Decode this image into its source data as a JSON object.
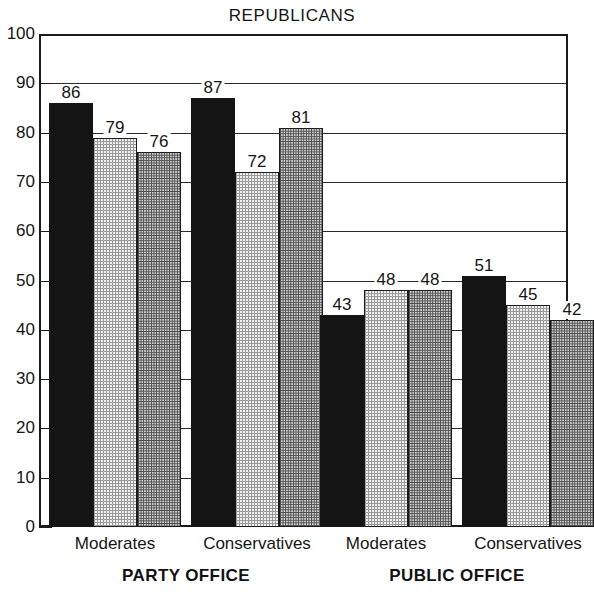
{
  "chart_data": {
    "type": "bar",
    "title": "REPUBLICANS",
    "xlabel": "",
    "ylabel": "",
    "ylim": [
      0,
      100
    ],
    "ytick_step": 10,
    "yticks": [
      0,
      10,
      20,
      30,
      40,
      50,
      60,
      70,
      80,
      90,
      100
    ],
    "grid": true,
    "legend": "none",
    "categories": [
      "Moderates",
      "Conservatives",
      "Moderates",
      "Conservatives"
    ],
    "group_labels": [
      "PARTY OFFICE",
      "PUBLIC OFFICE"
    ],
    "series": [
      {
        "name": "series-1",
        "fill": "solid-black",
        "values": [
          86,
          87,
          43,
          51
        ]
      },
      {
        "name": "series-2",
        "fill": "light-stipple",
        "values": [
          79,
          72,
          48,
          45
        ]
      },
      {
        "name": "series-3",
        "fill": "medium-stipple",
        "values": [
          76,
          81,
          48,
          42
        ]
      }
    ],
    "groups": [
      {
        "section": "PARTY OFFICE",
        "category": "Moderates",
        "bars": [
          {
            "value": 86,
            "label": "86",
            "fill": "solid-black"
          },
          {
            "value": 79,
            "label": "79",
            "fill": "light-stipple"
          },
          {
            "value": 76,
            "label": "76",
            "fill": "medium-stipple"
          }
        ]
      },
      {
        "section": "PARTY OFFICE",
        "category": "Conservatives",
        "bars": [
          {
            "value": 87,
            "label": "87",
            "fill": "solid-black"
          },
          {
            "value": 72,
            "label": "72",
            "fill": "light-stipple"
          },
          {
            "value": 81,
            "label": "81",
            "fill": "medium-stipple"
          }
        ]
      },
      {
        "section": "PUBLIC OFFICE",
        "category": "Moderates",
        "bars": [
          {
            "value": 43,
            "label": "43",
            "fill": "solid-black"
          },
          {
            "value": 48,
            "label": "48",
            "fill": "light-stipple"
          },
          {
            "value": 48,
            "label": "48",
            "fill": "medium-stipple"
          }
        ]
      },
      {
        "section": "PUBLIC OFFICE",
        "category": "Conservatives",
        "bars": [
          {
            "value": 51,
            "label": "51",
            "fill": "solid-black"
          },
          {
            "value": 45,
            "label": "45",
            "fill": "light-stipple"
          },
          {
            "value": 42,
            "label": "42",
            "fill": "medium-stipple"
          }
        ]
      }
    ],
    "colors": {
      "axis": "#1b1b1b",
      "grid": "#2a2a2a",
      "text": "#161616",
      "solid_black": "#141414",
      "light_stipple": "#f0f0f0",
      "medium_stipple": "#cfcfcf",
      "background": "#ffffff"
    }
  }
}
